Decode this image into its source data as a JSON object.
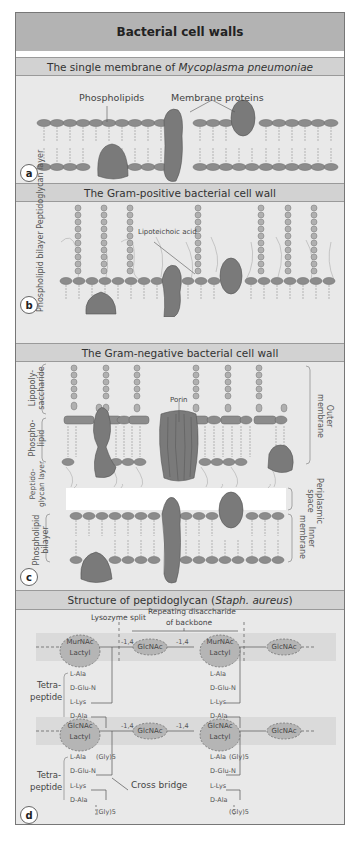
{
  "title": "Bacterial cell walls",
  "panels": {
    "a": {
      "heading_prefix": "The single membrane of ",
      "heading_italic": "Mycoplasma pneumoniae",
      "badge": "a",
      "labels": {
        "phospholipids": "Phospholipids",
        "membrane_proteins": "Membrane proteins"
      }
    },
    "b": {
      "heading": "The Gram-positive bacterial cell wall",
      "badge": "b",
      "labels": {
        "lipoteichoic_acid": "Lipoteichoic acid",
        "peptidoglycan_layer": "Peptidoglycan layer",
        "phospholipid_bilayer": "Phospholipid bilayer"
      }
    },
    "c": {
      "heading": "The Gram-negative bacterial cell wall",
      "badge": "c",
      "labels": {
        "porin": "Porin",
        "lipopolysaccharide": "Lipopoly- saccharide",
        "phospholipid": "Phospho- lipid",
        "peptidoglycan_layer": "Peptido- glycan layer",
        "phospholipid_bilayer": "Phospholipid bilayer",
        "outer_membrane": "Outer membrane",
        "periplasmic_space": "Periplasmic space",
        "inner_membrane": "Inner membrane"
      }
    },
    "d": {
      "heading_prefix": "Structure of peptidoglycan (",
      "heading_italic": "Staph. aureus",
      "heading_suffix": ")",
      "badge": "d",
      "labels": {
        "lysozyme_split": "Lysozyme split",
        "repeating_line1": "Repeating disaccharide",
        "repeating_line2": "of backbone",
        "tetrapeptide_top": "Tetra-",
        "tetrapeptide_bottom": "peptide",
        "cross_bridge": "Cross bridge",
        "bond": "-1,4",
        "murnac": "MurNAc",
        "glcnac": "GlcNAc",
        "lactyl": "Lactyl",
        "l_ala": "L-Ala",
        "d_glu_n": "D-Glu-N",
        "l_lys": "L-Lys",
        "d_ala": "D-Ala",
        "gly5": "(Gly)5"
      }
    }
  },
  "colors": {
    "frame_bg": "#e9e9e9",
    "title_bg": "#b3b3b3",
    "heading_bg": "#d2d2d2",
    "protein": "#7a7a7a",
    "head": "#8c8c8c",
    "tail": "#bdbdbd",
    "sugar": "#b0b0b0"
  }
}
